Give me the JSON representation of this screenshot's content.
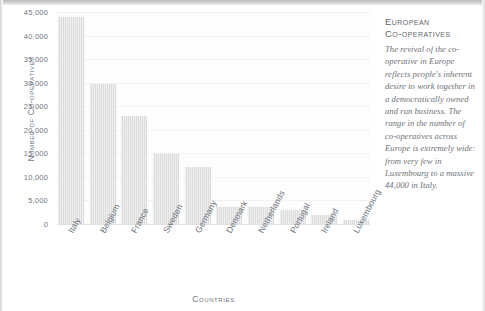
{
  "chart_data": {
    "type": "bar",
    "title": "",
    "xlabel": "Countries",
    "ylabel": "Number of Co-operatives",
    "categories": [
      "Italy",
      "Belgium",
      "France",
      "Sweden",
      "Germany",
      "Denmark",
      "Netherlands",
      "Portugal",
      "Ireland",
      "Luxembourg"
    ],
    "values": [
      44000,
      29800,
      23000,
      14800,
      12200,
      3700,
      3700,
      3000,
      2000,
      800
    ],
    "ylim": [
      0,
      45000
    ],
    "yticks": [
      "45,000",
      "40,000",
      "35,000",
      "30,000",
      "25,000",
      "20,000",
      "15,000",
      "10,000",
      "5,000",
      "0"
    ],
    "ytick_values": [
      45000,
      40000,
      35000,
      30000,
      25000,
      20000,
      15000,
      10000,
      5000,
      0
    ],
    "grid": true,
    "legend": "none",
    "bar_color": "#dcdcdc"
  },
  "panel": {
    "heading_line1": "European",
    "heading_line2": "Co-operatives",
    "body": "The revival of the co-operative in Europe reflects people's inherent desire to work together in a democratically owned and run business. The range in the number of co-operatives across Europe is extremely wide: from very few in Luxembourg to a massive 44,000 in Italy."
  },
  "colors": {
    "bar": "#dcdcdc",
    "text": "#6e7178",
    "heading": "#62666f",
    "grid": "#f2f2f2",
    "background": "#ffffff"
  }
}
